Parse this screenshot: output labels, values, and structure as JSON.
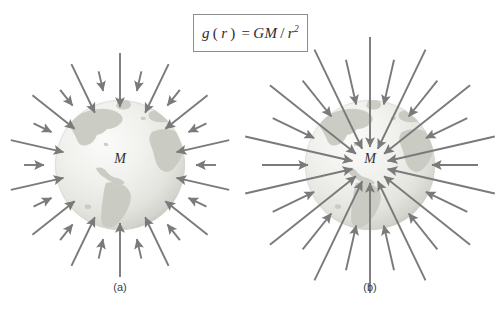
{
  "figure": {
    "background_color": "#ffffff",
    "width": 497,
    "height": 317,
    "formula": {
      "function_name": "g",
      "variable": "r",
      "equals": "=",
      "numerator": "GM",
      "denominator": "r",
      "exponent": "2",
      "full_text": "g(r) = GM/r^2",
      "border_color": "#8d8d8d"
    },
    "panels": [
      {
        "id": "a",
        "label": "(a)",
        "mass_label": "M",
        "center_x": 120,
        "center_y": 165,
        "globe_radius": 65,
        "arrow_color": "#7a7a7a",
        "description": "short uniform inward gravitational field arrows",
        "arrow_count": 28,
        "arrow_tail_radius_long": 112,
        "arrow_tail_radius_short": 96,
        "arrow_head_radius_long": 58,
        "arrow_head_radius_short": 76
      },
      {
        "id": "b",
        "label": "(b)",
        "mass_label": "M",
        "center_x": 370,
        "center_y": 165,
        "globe_radius": 65,
        "arrow_color": "#7a7a7a",
        "description": "long inward gravitational field arrows penetrating the sphere",
        "arrow_count": 28,
        "arrow_tail_radius_long": 128,
        "arrow_tail_radius_short": 108,
        "arrow_head_radius_long": 18,
        "arrow_head_radius_short": 62
      }
    ],
    "globe": {
      "ocean_light": "#f4f4f2",
      "ocean_mid": "#e8e8e4",
      "ocean_edge": "#d2d2cc",
      "land_color": "#c9cbc2",
      "land_color_dark": "#b9bcb1",
      "continents": [
        "north-america",
        "south-america",
        "greenland",
        "europe",
        "africa"
      ]
    }
  }
}
